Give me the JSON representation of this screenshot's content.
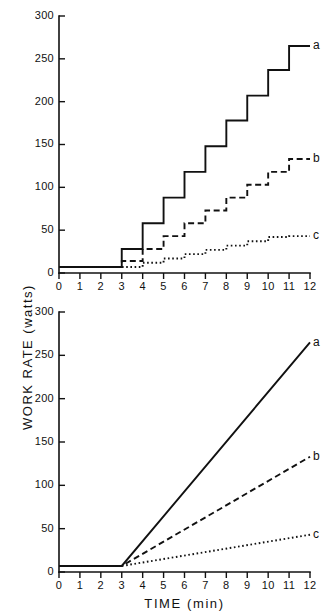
{
  "figure": {
    "ylabel": "WORK RATE  (watts)",
    "xlabel": "TIME  (min)"
  },
  "axes": {
    "y_ticks": [
      "0",
      "50",
      "100",
      "150",
      "200",
      "250",
      "300"
    ],
    "x_ticks": [
      "0",
      "1",
      "2",
      "3",
      "4",
      "5",
      "6",
      "7",
      "8",
      "9",
      "10",
      "11",
      "12"
    ],
    "ylim": [
      0,
      300
    ],
    "xlim": [
      0,
      12
    ]
  },
  "series_labels": {
    "a": "a",
    "b": "b",
    "c": "c"
  },
  "chart_data": [
    {
      "type": "line",
      "panel": "top",
      "subtype": "step",
      "title": "",
      "xlabel": "",
      "ylabel": "WORK RATE  (watts)",
      "xlim": [
        0,
        12
      ],
      "ylim": [
        0,
        300
      ],
      "grid": false,
      "legend_position": "right-end-of-line",
      "x_ticks": [
        0,
        1,
        2,
        3,
        4,
        5,
        6,
        7,
        8,
        9,
        10,
        11,
        12
      ],
      "y_ticks": [
        0,
        50,
        100,
        150,
        200,
        250,
        300
      ],
      "x": [
        0,
        3,
        4,
        5,
        6,
        7,
        8,
        9,
        10,
        11,
        12
      ],
      "series": [
        {
          "name": "a",
          "style": "solid",
          "step_increment": 30,
          "values": [
            7,
            28,
            58,
            88,
            118,
            148,
            178,
            207,
            237,
            265,
            265
          ]
        },
        {
          "name": "b",
          "style": "dashed",
          "step_increment": 15,
          "values": [
            7,
            14,
            28,
            43,
            58,
            73,
            88,
            103,
            118,
            133,
            133
          ]
        },
        {
          "name": "c",
          "style": "dotted",
          "step_increment": 5,
          "values": [
            7,
            7,
            12,
            17,
            22,
            27,
            32,
            37,
            42,
            43,
            43
          ]
        }
      ]
    },
    {
      "type": "line",
      "panel": "bottom",
      "subtype": "ramp",
      "title": "",
      "xlabel": "TIME  (min)",
      "ylabel": "WORK RATE  (watts)",
      "xlim": [
        0,
        12
      ],
      "ylim": [
        0,
        300
      ],
      "grid": false,
      "legend_position": "right-end-of-line",
      "x_ticks": [
        0,
        1,
        2,
        3,
        4,
        5,
        6,
        7,
        8,
        9,
        10,
        11,
        12
      ],
      "y_ticks": [
        0,
        50,
        100,
        150,
        200,
        250,
        300
      ],
      "x": [
        0,
        3,
        12
      ],
      "series": [
        {
          "name": "a",
          "style": "solid",
          "slope_w_per_min": 28.7,
          "values": [
            7,
            7,
            265
          ]
        },
        {
          "name": "b",
          "style": "dashed",
          "slope_w_per_min": 14.0,
          "values": [
            7,
            7,
            133
          ]
        },
        {
          "name": "c",
          "style": "dotted",
          "slope_w_per_min": 4.0,
          "values": [
            7,
            7,
            43
          ]
        }
      ]
    }
  ]
}
